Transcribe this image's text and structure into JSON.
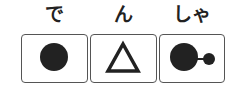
{
  "word": "でんしゃ",
  "units": [
    {
      "kana": "で",
      "symbol": "filled-circle"
    },
    {
      "kana": "ん",
      "symbol": "triangle-outline"
    },
    {
      "kana": "しゃ",
      "symbol": "filled-circle-with-small-circle"
    }
  ],
  "colors": {
    "ink": "#222222",
    "border": "#555555"
  }
}
